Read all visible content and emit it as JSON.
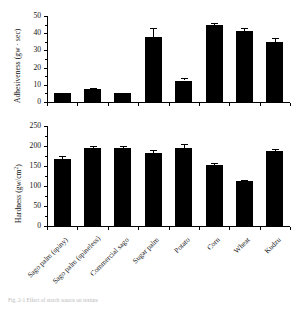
{
  "figure": {
    "caption": "Fig. 2-1 Effect of starch source on texture",
    "background": "#ffffff",
    "bar_color": "#000000"
  },
  "chart_data": [
    {
      "type": "bar",
      "panel": "top",
      "title": "",
      "xlabel": "",
      "ylabel": "Adhesiveness (gw · sec)",
      "ylabel_main": "Adhesiveness (gw",
      "ylabel_mid": " · sec)",
      "ylim": [
        0,
        50
      ],
      "yticks": [
        0,
        10,
        20,
        30,
        40,
        50
      ],
      "ytick_labels": [
        "0",
        "10",
        "20",
        "30",
        "40",
        "50"
      ],
      "grid": false,
      "legend": "none",
      "categories": [
        "Sago palm (spiny)",
        "Sago palm (spineless)",
        "Commercial sago",
        "Sugar palm",
        "Potato",
        "Corn",
        "Wheat",
        "Kudzu"
      ],
      "values": [
        5.0,
        7.5,
        5.0,
        38.0,
        12.5,
        44.5,
        41.0,
        35.0
      ],
      "errors": [
        0.5,
        0.8,
        0.5,
        5.0,
        1.5,
        1.5,
        1.8,
        2.0
      ]
    },
    {
      "type": "bar",
      "panel": "bottom",
      "title": "",
      "xlabel": "",
      "ylabel": "Hardness (gw/cm2)",
      "ylabel_main": "Hardness (gw/cm",
      "ylabel_sup": "2",
      "ylabel_tail": ")",
      "ylim": [
        0,
        250
      ],
      "yticks": [
        0,
        50,
        100,
        150,
        200,
        250
      ],
      "ytick_labels": [
        "0",
        "50",
        "100",
        "150",
        "200",
        "250"
      ],
      "grid": false,
      "legend": "none",
      "categories": [
        "Sago palm (spiny)",
        "Sago palm (spineless)",
        "Commercial sago",
        "Sugar palm",
        "Potato",
        "Corn",
        "Wheat",
        "Kudzu"
      ],
      "values": [
        168,
        196,
        195,
        182,
        196,
        152,
        112,
        188
      ],
      "errors": [
        6,
        4,
        6,
        8,
        10,
        5,
        4,
        5
      ]
    }
  ]
}
